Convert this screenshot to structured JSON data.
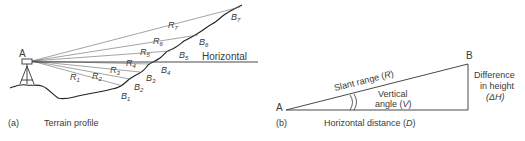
{
  "panel_a": {
    "caption_letter": "(a)",
    "caption_text": "Terrain profile",
    "station_label": "A",
    "horizontal_label": "Horizontal",
    "rays": [
      {
        "r": "R",
        "sub": "1",
        "b": "B",
        "bsub": "1"
      },
      {
        "r": "R",
        "sub": "2",
        "b": "B",
        "bsub": "2"
      },
      {
        "r": "R",
        "sub": "3",
        "b": "B",
        "bsub": "3"
      },
      {
        "r": "R",
        "sub": "4",
        "b": "B",
        "bsub": "4"
      },
      {
        "r": "R",
        "sub": "5",
        "b": "B",
        "bsub": "5"
      },
      {
        "r": "R",
        "sub": "6",
        "b": "B",
        "bsub": "6"
      },
      {
        "r": "R",
        "sub": "7",
        "b": "B",
        "bsub": "7"
      }
    ]
  },
  "panel_b": {
    "caption_letter": "(b)",
    "point_a": "A",
    "point_b": "B",
    "slant_range": "Slant range (",
    "slant_symbol": "R",
    "vertical_line1": "Vertical",
    "vertical_line2": "angle (",
    "vertical_symbol": "V",
    "diff_line1": "Difference",
    "diff_line2": "in height",
    "diff_symbol": "(ΔH)",
    "horizontal_distance": "Horizontal distance (",
    "horizontal_symbol": "D",
    "close_paren": ")"
  }
}
